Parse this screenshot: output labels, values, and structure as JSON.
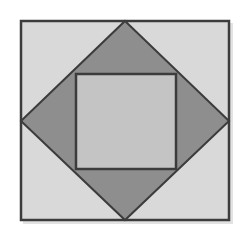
{
  "diagram": {
    "colors": {
      "background": "#ffffff",
      "outer_square_fill": "#d9d9d9",
      "diamond_fill": "#8e8e8e",
      "inner_square_fill": "#c4c4c4",
      "stroke": "#3c3c3c",
      "shadow": "#bdbdbd"
    },
    "shapes": {
      "outer_square": {
        "x": 21,
        "y": 21,
        "width": 208,
        "height": 199
      },
      "diamond": {
        "top": [
          125,
          21
        ],
        "right": [
          229,
          121
        ],
        "bottom": [
          125,
          220
        ],
        "left": [
          21,
          121
        ]
      },
      "inner_square": {
        "x": 76,
        "y": 74,
        "width": 100,
        "height": 95
      }
    }
  }
}
